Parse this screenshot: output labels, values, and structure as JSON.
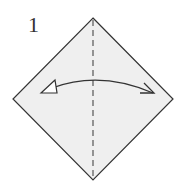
{
  "diagram": {
    "step_number": "1",
    "paper_color": "#efefef",
    "line_color": "#333333",
    "shapes": {
      "paper": "square-rotated-45",
      "fold_line": "valley-fold-vertical-dashed",
      "arrow": "fold-and-unfold-arrow"
    }
  }
}
